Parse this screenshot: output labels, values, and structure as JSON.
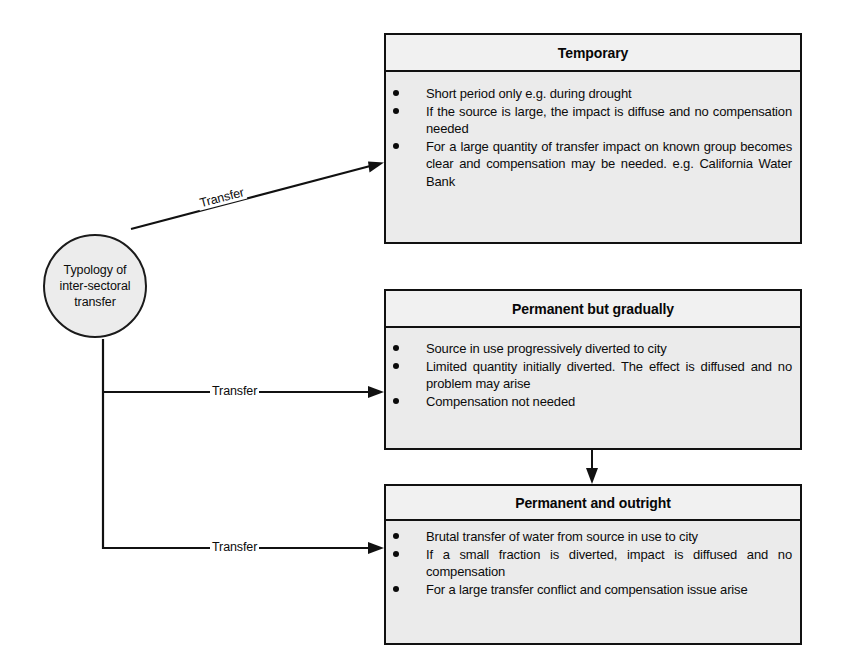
{
  "diagram": {
    "title": "Typology of inter-sectoral transfer",
    "root_node": {
      "label": "Typology of\ninter-sectoral\ntransfer",
      "shape": "circle"
    },
    "edges": [
      {
        "id": "edge-to-temporary",
        "label": "Transfer",
        "from": "root",
        "to": "temporary"
      },
      {
        "id": "edge-to-permanent-gradually",
        "label": "Transfer",
        "from": "root",
        "to": "permanent-but-gradually"
      },
      {
        "id": "edge-to-permanent-outright",
        "label": "Transfer",
        "from": "root",
        "to": "permanent-and-outright"
      },
      {
        "id": "edge-gradually-to-outright",
        "label": "",
        "from": "permanent-but-gradually",
        "to": "permanent-and-outright"
      }
    ],
    "boxes": [
      {
        "id": "temporary",
        "title": "Temporary",
        "bullets": [
          "Short period only e.g. during drought",
          "If the source is large, the impact is diffuse and no compensation needed",
          "For a large quantity of transfer impact on known group becomes clear and compensation may be needed. e.g. California Water Bank"
        ]
      },
      {
        "id": "permanent-but-gradually",
        "title": "Permanent but gradually",
        "bullets": [
          "Source in use progressively diverted to city",
          "Limited quantity initially diverted. The effect is diffused and no problem may arise",
          "Compensation not needed"
        ]
      },
      {
        "id": "permanent-and-outright",
        "title": "Permanent and outright",
        "bullets": [
          "Brutal transfer of water from source in use to city",
          "If a small fraction is diverted, impact is diffused and no compensation",
          "For a large transfer conflict and compensation issue arise"
        ]
      }
    ],
    "colors": {
      "box_fill": "#ebebeb",
      "box_title_fill": "#f1f1f1",
      "stroke": "#111111",
      "page_background": "#ffffff"
    }
  }
}
